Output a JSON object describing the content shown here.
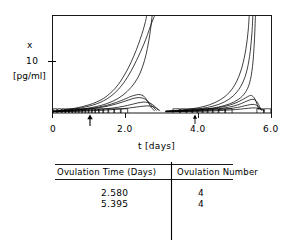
{
  "figure": {
    "title": "",
    "axis": {
      "y_variable_label": "x",
      "y_units_label": "[pg/ml]",
      "y_tick_label": "10",
      "x_axis_title": "t [days]",
      "x_tick_labels": [
        "0",
        "2.0",
        "4.0",
        "6.0"
      ]
    },
    "markers": {
      "arrow_up_1": "↑",
      "arrow_up_2": "↑"
    }
  },
  "chart_data": {
    "type": "line",
    "title": "",
    "xlabel": "t [days]",
    "ylabel": "x",
    "yunits": "[pg/ml]",
    "xlim": [
      0.0,
      6.0
    ],
    "ylim": [
      0.0,
      22.0
    ],
    "xticks": [
      0.0,
      2.0,
      4.0,
      6.0
    ],
    "xticklabels": [
      "0",
      "2.0",
      "4.0",
      "6.0"
    ],
    "yticks": [
      10.0
    ],
    "yticklabels": [
      "10"
    ],
    "grid": false,
    "legend": null,
    "annotations": [
      {
        "type": "arrow-up",
        "x": 1.03,
        "label": ""
      },
      {
        "type": "arrow-up",
        "x": 3.92,
        "label": ""
      }
    ],
    "series": [
      {
        "name": "trajectory-1",
        "comment": "fastest riser, burst 1",
        "x": [
          0.0,
          0.2,
          0.4,
          0.6,
          0.8,
          1.0,
          1.2,
          1.4,
          1.6,
          1.8,
          2.0,
          2.15,
          2.3,
          2.4,
          2.48,
          2.53,
          2.56,
          2.58
        ],
        "y": [
          0.45,
          0.6,
          0.8,
          1.05,
          1.4,
          1.85,
          2.45,
          3.3,
          4.6,
          6.4,
          9.0,
          11.4,
          14.3,
          16.6,
          18.6,
          20.1,
          21.1,
          22.0
        ]
      },
      {
        "name": "trajectory-2",
        "comment": "burst 1",
        "x": [
          0.0,
          0.2,
          0.4,
          0.6,
          0.8,
          1.0,
          1.2,
          1.4,
          1.6,
          1.8,
          2.0,
          2.2,
          2.4,
          2.55,
          2.65,
          2.72,
          2.77,
          2.8
        ],
        "y": [
          0.4,
          0.52,
          0.68,
          0.9,
          1.18,
          1.55,
          2.05,
          2.75,
          3.8,
          5.3,
          7.4,
          10.2,
          13.6,
          16.5,
          18.8,
          20.4,
          21.4,
          22.0
        ]
      },
      {
        "name": "trajectory-3",
        "comment": "burst 1, steep late",
        "x": [
          0.0,
          0.3,
          0.6,
          0.9,
          1.2,
          1.5,
          1.8,
          2.05,
          2.25,
          2.4,
          2.52,
          2.6,
          2.66,
          2.7,
          2.73
        ],
        "y": [
          0.38,
          0.5,
          0.7,
          1.0,
          1.45,
          2.15,
          3.3,
          4.9,
          6.8,
          9.0,
          11.8,
          14.6,
          17.4,
          19.8,
          22.0
        ]
      },
      {
        "name": "trajectory-4",
        "comment": "medium peak then decay",
        "x": [
          0.0,
          0.25,
          0.5,
          0.75,
          1.0,
          1.25,
          1.5,
          1.75,
          2.0,
          2.15,
          2.3,
          2.4,
          2.5,
          2.58,
          2.65,
          2.72,
          2.8
        ],
        "y": [
          0.35,
          0.45,
          0.58,
          0.75,
          0.98,
          1.3,
          1.75,
          2.4,
          3.2,
          3.75,
          4.1,
          4.15,
          3.8,
          3.0,
          2.0,
          1.1,
          0.5
        ]
      },
      {
        "name": "trajectory-5",
        "comment": "medium peak then decay",
        "x": [
          0.0,
          0.25,
          0.5,
          0.75,
          1.0,
          1.25,
          1.5,
          1.75,
          2.0,
          2.18,
          2.32,
          2.45,
          2.55,
          2.65,
          2.75,
          2.85
        ],
        "y": [
          0.32,
          0.4,
          0.52,
          0.68,
          0.88,
          1.15,
          1.52,
          2.05,
          2.7,
          3.2,
          3.45,
          3.4,
          3.05,
          2.35,
          1.4,
          0.55
        ]
      },
      {
        "name": "trajectory-6",
        "comment": "low peak then decay",
        "x": [
          0.0,
          0.3,
          0.6,
          0.9,
          1.2,
          1.5,
          1.8,
          2.05,
          2.25,
          2.42,
          2.55,
          2.68,
          2.8,
          2.9
        ],
        "y": [
          0.3,
          0.36,
          0.45,
          0.58,
          0.75,
          0.98,
          1.3,
          1.7,
          2.1,
          2.4,
          2.45,
          2.2,
          1.5,
          0.6
        ]
      },
      {
        "name": "trajectory-7",
        "comment": "lowest burst-1 peak",
        "x": [
          0.0,
          0.35,
          0.7,
          1.05,
          1.4,
          1.75,
          2.05,
          2.3,
          2.5,
          2.68,
          2.82,
          2.95
        ],
        "y": [
          0.28,
          0.33,
          0.4,
          0.5,
          0.64,
          0.84,
          1.08,
          1.35,
          1.55,
          1.58,
          1.2,
          0.5
        ]
      },
      {
        "name": "trajectory-8",
        "comment": "burst 2 fastest riser",
        "x": [
          3.1,
          3.4,
          3.7,
          4.0,
          4.3,
          4.6,
          4.85,
          5.05,
          5.2,
          5.3,
          5.36,
          5.39
        ],
        "y": [
          0.42,
          0.58,
          0.82,
          1.2,
          1.85,
          3.0,
          4.7,
          7.2,
          10.6,
          14.5,
          18.5,
          22.0
        ]
      },
      {
        "name": "trajectory-9",
        "comment": "burst 2",
        "x": [
          3.1,
          3.45,
          3.8,
          4.1,
          4.4,
          4.7,
          4.95,
          5.15,
          5.3,
          5.4,
          5.46,
          5.49
        ],
        "y": [
          0.4,
          0.54,
          0.75,
          1.05,
          1.55,
          2.45,
          3.85,
          5.9,
          8.8,
          12.8,
          17.6,
          22.0
        ]
      },
      {
        "name": "trajectory-10",
        "comment": "burst 2",
        "x": [
          3.1,
          3.5,
          3.9,
          4.25,
          4.55,
          4.85,
          5.1,
          5.28,
          5.4,
          5.48,
          5.53,
          5.56
        ],
        "y": [
          0.38,
          0.5,
          0.68,
          0.95,
          1.35,
          2.05,
          3.1,
          4.6,
          6.8,
          10.5,
          16.0,
          22.0
        ]
      },
      {
        "name": "trajectory-11",
        "comment": "burst 2 medium peak then decay",
        "x": [
          3.1,
          3.45,
          3.8,
          4.15,
          4.45,
          4.75,
          5.0,
          5.2,
          5.35,
          5.45,
          5.55,
          5.65
        ],
        "y": [
          0.35,
          0.46,
          0.6,
          0.8,
          1.1,
          1.55,
          2.2,
          3.0,
          3.7,
          3.95,
          3.1,
          0.8
        ]
      },
      {
        "name": "trajectory-12",
        "comment": "burst 2 medium peak then decay",
        "x": [
          3.1,
          3.5,
          3.9,
          4.25,
          4.55,
          4.85,
          5.08,
          5.26,
          5.4,
          5.52,
          5.62,
          5.72
        ],
        "y": [
          0.33,
          0.42,
          0.54,
          0.72,
          0.98,
          1.35,
          1.85,
          2.45,
          2.95,
          3.05,
          2.3,
          0.6
        ]
      },
      {
        "name": "trajectory-13",
        "comment": "burst 2 low peak",
        "x": [
          3.1,
          3.55,
          4.0,
          4.35,
          4.65,
          4.95,
          5.18,
          5.35,
          5.5,
          5.62,
          5.74
        ],
        "y": [
          0.3,
          0.37,
          0.47,
          0.62,
          0.82,
          1.1,
          1.45,
          1.78,
          1.95,
          1.6,
          0.55
        ]
      },
      {
        "name": "trajectory-14",
        "comment": "burst 2 lowest peak",
        "x": [
          3.1,
          3.6,
          4.1,
          4.5,
          4.85,
          5.15,
          5.38,
          5.56,
          5.7,
          5.82
        ],
        "y": [
          0.28,
          0.33,
          0.41,
          0.52,
          0.67,
          0.88,
          1.08,
          1.15,
          0.92,
          0.45
        ]
      }
    ],
    "baseline_tick_boxes": {
      "comment": "small rectangular follicle/pulse markers drawn along the y=0 baseline",
      "y_top": 0.95,
      "segments": [
        [
          0.02,
          0.12
        ],
        [
          0.14,
          0.24
        ],
        [
          0.26,
          0.34
        ],
        [
          0.36,
          0.44
        ],
        [
          0.46,
          0.53
        ],
        [
          0.55,
          0.62
        ],
        [
          0.64,
          0.71
        ],
        [
          0.73,
          0.8
        ],
        [
          0.82,
          0.89
        ],
        [
          0.91,
          0.98
        ],
        [
          1.0,
          1.07
        ],
        [
          1.09,
          1.16
        ],
        [
          1.18,
          1.26
        ],
        [
          1.28,
          1.38
        ],
        [
          1.4,
          1.52
        ],
        [
          1.54,
          1.68
        ],
        [
          1.7,
          1.86
        ],
        [
          1.88,
          2.06
        ],
        [
          3.3,
          3.48
        ],
        [
          3.5,
          3.66
        ],
        [
          3.68,
          3.82
        ],
        [
          3.84,
          3.96
        ],
        [
          3.98,
          4.1
        ],
        [
          4.12,
          4.24
        ],
        [
          4.26,
          4.38
        ],
        [
          4.4,
          4.54
        ],
        [
          4.56,
          4.72
        ],
        [
          4.74,
          4.92
        ],
        [
          5.6,
          5.78
        ],
        [
          5.8,
          5.98
        ]
      ]
    }
  },
  "table": {
    "columns": [
      "Ovulation Time (Days)",
      "Ovulation Number"
    ],
    "rows": [
      {
        "ovulation_time": "2.580",
        "ovulation_number": "4"
      },
      {
        "ovulation_time": "5.395",
        "ovulation_number": "4"
      }
    ]
  },
  "colors": {
    "line": "#000000",
    "axis": "#000000",
    "background": "#ffffff",
    "text": "#000000"
  }
}
